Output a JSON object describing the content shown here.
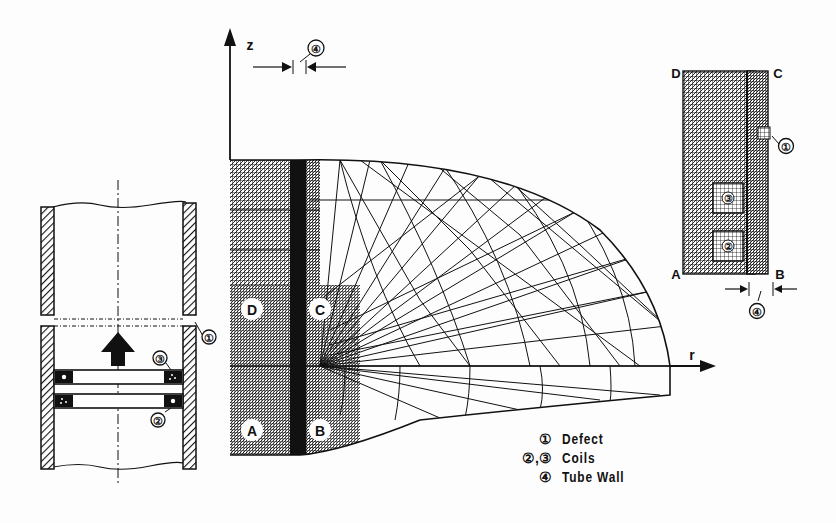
{
  "figure": {
    "tube_section": {
      "markers": {
        "defect": "①",
        "coil_upper": "③",
        "coil_lower": "②"
      },
      "arrow": "probe-travel-up"
    },
    "mesh": {
      "axis_z": "z",
      "axis_r": "r",
      "wall_marker": "④",
      "corners": {
        "A": "A",
        "B": "B",
        "C": "C",
        "D": "D"
      }
    },
    "detail": {
      "corners": {
        "A": "A",
        "B": "B",
        "C": "C",
        "D": "D"
      },
      "markers": {
        "defect": "①",
        "coil_upper": "③",
        "coil_lower": "②",
        "wall": "④"
      }
    },
    "legend": [
      {
        "key": "①",
        "label": "Defect"
      },
      {
        "key": "②,③",
        "label": "Coils"
      },
      {
        "key": "④",
        "label": "Tube Wall"
      }
    ]
  }
}
